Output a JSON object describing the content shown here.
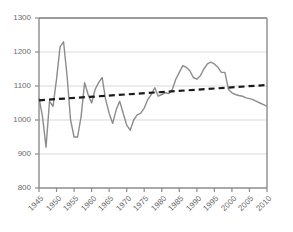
{
  "chart_data": {
    "type": "line",
    "title": "",
    "subtitle": "",
    "xlabel": "",
    "ylabel": "",
    "xlim": [
      1945,
      2010
    ],
    "ylim": [
      800,
      1300
    ],
    "grid": true,
    "legend": "none",
    "y_ticks": [
      800,
      900,
      1000,
      1100,
      1200,
      1300
    ],
    "x_ticks": [
      1945,
      1950,
      1955,
      1960,
      1965,
      1970,
      1975,
      1980,
      1985,
      1990,
      1995,
      2000,
      2005,
      2010
    ],
    "x_tick_labels": [
      "1945",
      "1950",
      "1955",
      "1960",
      "1965",
      "1970",
      "1975",
      "1980",
      "1985",
      "1990",
      "1995",
      "2000",
      "2005",
      "2010"
    ],
    "y_tick_labels": [
      "800",
      "900",
      "1000",
      "1100",
      "1200",
      "1300"
    ],
    "series": [
      {
        "name": "annual-value",
        "style": "solid",
        "color": "#8c8c8c",
        "x": [
          1945,
          1946,
          1947,
          1948,
          1949,
          1950,
          1951,
          1952,
          1953,
          1954,
          1955,
          1956,
          1957,
          1958,
          1959,
          1960,
          1961,
          1962,
          1963,
          1964,
          1965,
          1966,
          1967,
          1968,
          1969,
          1970,
          1971,
          1972,
          1973,
          1974,
          1975,
          1976,
          1977,
          1978,
          1979,
          1980,
          1981,
          1982,
          1983,
          1984,
          1985,
          1986,
          1987,
          1988,
          1989,
          1990,
          1991,
          1992,
          1993,
          1994,
          1995,
          1996,
          1997,
          1998,
          1999,
          2000,
          2001,
          2002,
          2003,
          2004,
          2005,
          2006,
          2007,
          2008,
          2009,
          2010
        ],
        "values": [
          1065,
          1010,
          920,
          1055,
          1040,
          1120,
          1215,
          1230,
          1130,
          1000,
          950,
          950,
          1010,
          1110,
          1075,
          1050,
          1090,
          1110,
          1125,
          1060,
          1020,
          990,
          1030,
          1055,
          1020,
          985,
          970,
          1000,
          1015,
          1020,
          1035,
          1060,
          1075,
          1095,
          1070,
          1075,
          1080,
          1078,
          1090,
          1120,
          1140,
          1160,
          1155,
          1145,
          1125,
          1120,
          1130,
          1150,
          1165,
          1170,
          1165,
          1155,
          1140,
          1140,
          1090,
          1080,
          1075,
          1072,
          1070,
          1065,
          1063,
          1060,
          1055,
          1050,
          1045,
          1040
        ]
      },
      {
        "name": "linear-trend",
        "style": "dashed",
        "color": "#1a1a1a",
        "x": [
          1945,
          2010
        ],
        "values": [
          1058,
          1103
        ]
      }
    ]
  },
  "axes": {
    "axis_color": "#8c8c8c",
    "grid_color": "#d9d9d9",
    "tick_label_color": "#6b6b6b",
    "top_rule_color": "#9a9a9a"
  }
}
